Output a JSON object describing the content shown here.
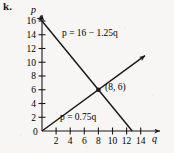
{
  "figure": {
    "part_label": "k.",
    "background_color": "#f7f6f4",
    "ink_color": "#1a1a1a"
  },
  "chart_data": {
    "type": "line",
    "title": "",
    "xlabel": "q",
    "ylabel": "p",
    "xlim": [
      0,
      15.5
    ],
    "ylim": [
      0,
      17.5
    ],
    "grid": false,
    "legend": "inline-labels",
    "x_ticks": [
      2,
      4,
      6,
      8,
      10,
      12,
      14
    ],
    "x_tick_labels": [
      "2",
      "4",
      "6",
      "8",
      "10",
      "12",
      "14"
    ],
    "y_ticks": [
      0,
      2,
      4,
      6,
      8,
      10,
      12,
      14,
      16
    ],
    "y_tick_labels": [
      "0",
      "2",
      "4",
      "6",
      "8",
      "10",
      "12",
      "14",
      "16"
    ],
    "origin_label": "0",
    "series": [
      {
        "name": "demand",
        "equation_label": "p = 16 − 1.25q",
        "slope": -1.25,
        "intercept": 16,
        "x_start": 0,
        "y_start": 16,
        "x_end": 12.8,
        "y_end": 0,
        "arrow_at": "start",
        "label_x": 4.2,
        "label_y": 14.2
      },
      {
        "name": "supply",
        "equation_label": "p = 0.75q",
        "slope": 0.75,
        "intercept": 0,
        "x_start": 0,
        "y_start": 0,
        "x_end": 14.6,
        "y_end": 10.95,
        "arrow_at": "end",
        "label_x": 4.1,
        "label_y": 2.6
      }
    ],
    "annotations": [
      {
        "name": "equilibrium-point",
        "label": "(8, 6)",
        "x": 8,
        "y": 6,
        "marker": "dot"
      }
    ]
  }
}
